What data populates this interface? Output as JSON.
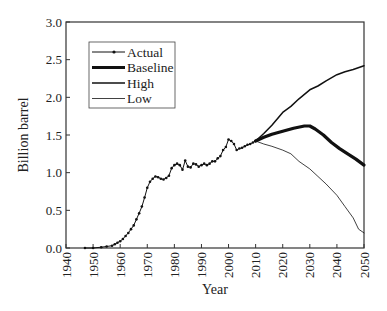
{
  "chart_data": {
    "type": "line",
    "title": "",
    "xlabel": "Year",
    "ylabel": "Billion barrel",
    "xlim": [
      1940,
      2050
    ],
    "ylim": [
      0.0,
      3.0
    ],
    "grid": false,
    "legend_position": "upper left",
    "x_ticks": [
      "1940",
      "1950",
      "1960",
      "1970",
      "1980",
      "1990",
      "2000",
      "2010",
      "2020",
      "2030",
      "2040",
      "2050"
    ],
    "y_ticks": [
      "0.0",
      "0.5",
      "1.0",
      "1.5",
      "2.0",
      "2.5",
      "3.0"
    ],
    "legend": [
      "Actual",
      "Baseline",
      "High",
      "Low"
    ],
    "series": [
      {
        "name": "Actual",
        "style": "thin line with dot markers",
        "x": [
          1947,
          1950,
          1953,
          1955,
          1957,
          1958,
          1959,
          1960,
          1961,
          1962,
          1963,
          1964,
          1965,
          1966,
          1967,
          1968,
          1969,
          1970,
          1971,
          1972,
          1973,
          1974,
          1975,
          1976,
          1977,
          1978,
          1979,
          1980,
          1981,
          1982,
          1983,
          1984,
          1985,
          1986,
          1987,
          1988,
          1989,
          1990,
          1991,
          1992,
          1993,
          1994,
          1995,
          1996,
          1997,
          1998,
          1999,
          2000,
          2001,
          2002,
          2003,
          2004,
          2005,
          2006,
          2007,
          2008,
          2009,
          2010
        ],
        "values": [
          0.0,
          0.0,
          0.01,
          0.02,
          0.03,
          0.05,
          0.07,
          0.09,
          0.12,
          0.16,
          0.2,
          0.25,
          0.3,
          0.38,
          0.46,
          0.55,
          0.67,
          0.8,
          0.88,
          0.92,
          0.95,
          0.94,
          0.92,
          0.91,
          0.93,
          0.96,
          1.06,
          1.1,
          1.12,
          1.1,
          1.04,
          1.16,
          1.08,
          1.07,
          1.12,
          1.11,
          1.08,
          1.1,
          1.12,
          1.1,
          1.12,
          1.15,
          1.15,
          1.19,
          1.22,
          1.3,
          1.34,
          1.44,
          1.42,
          1.38,
          1.3,
          1.32,
          1.33,
          1.35,
          1.37,
          1.38,
          1.4,
          1.42
        ]
      },
      {
        "name": "Baseline",
        "style": "thick line",
        "x": [
          2010,
          2013,
          2016,
          2020,
          2024,
          2028,
          2030,
          2032,
          2035,
          2038,
          2041,
          2044,
          2047,
          2050
        ],
        "values": [
          1.42,
          1.47,
          1.51,
          1.55,
          1.59,
          1.62,
          1.62,
          1.58,
          1.5,
          1.4,
          1.32,
          1.25,
          1.18,
          1.1
        ]
      },
      {
        "name": "High",
        "style": "medium line",
        "x": [
          2010,
          2013,
          2016,
          2020,
          2023,
          2026,
          2030,
          2033,
          2036,
          2040,
          2043,
          2046,
          2050
        ],
        "values": [
          1.42,
          1.52,
          1.63,
          1.8,
          1.88,
          1.98,
          2.1,
          2.15,
          2.22,
          2.3,
          2.34,
          2.37,
          2.42
        ]
      },
      {
        "name": "Low",
        "style": "thin line",
        "x": [
          2010,
          2013,
          2016,
          2020,
          2023,
          2026,
          2030,
          2033,
          2036,
          2040,
          2043,
          2046,
          2048,
          2050
        ],
        "values": [
          1.42,
          1.38,
          1.35,
          1.3,
          1.25,
          1.15,
          1.05,
          0.95,
          0.85,
          0.7,
          0.55,
          0.4,
          0.25,
          0.2
        ]
      }
    ]
  }
}
